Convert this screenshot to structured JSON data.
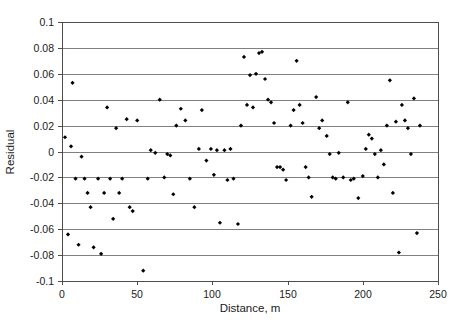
{
  "chart_data": {
    "type": "scatter",
    "title": "",
    "xlabel": "Distance, m",
    "ylabel": "Residual",
    "xlim": [
      0,
      250
    ],
    "ylim": [
      -0.1,
      0.1
    ],
    "xticks": [
      0,
      50,
      100,
      150,
      200,
      250
    ],
    "yticks": [
      -0.1,
      -0.08,
      -0.06,
      -0.04,
      -0.02,
      0,
      0.02,
      0.04,
      0.06,
      0.08,
      0.1
    ],
    "xtick_labels": [
      "0",
      "50",
      "100",
      "150",
      "200",
      "250"
    ],
    "ytick_labels": [
      "-0.1",
      "-0.08",
      "-0.06",
      "-0.04",
      "-0.02",
      "0",
      "0.02",
      "0.04",
      "0.06",
      "0.08",
      "0.1"
    ],
    "grid": "horizontal",
    "legend": null,
    "marker": "filled-diamond",
    "marker_color": "#000000",
    "points": [
      [
        2,
        0.011
      ],
      [
        4,
        -0.064
      ],
      [
        6,
        0.004
      ],
      [
        7,
        0.053
      ],
      [
        9,
        -0.021
      ],
      [
        11,
        -0.072
      ],
      [
        13,
        -0.004
      ],
      [
        15,
        -0.021
      ],
      [
        17,
        -0.032
      ],
      [
        19,
        -0.043
      ],
      [
        21,
        -0.074
      ],
      [
        24,
        -0.021
      ],
      [
        26,
        -0.079
      ],
      [
        28,
        -0.032
      ],
      [
        30,
        0.034
      ],
      [
        32,
        -0.021
      ],
      [
        34,
        -0.052
      ],
      [
        36,
        0.018
      ],
      [
        38,
        -0.032
      ],
      [
        40,
        -0.021
      ],
      [
        43,
        0.025
      ],
      [
        45,
        -0.043
      ],
      [
        47,
        -0.046
      ],
      [
        50,
        0.024
      ],
      [
        54,
        -0.092
      ],
      [
        57,
        -0.021
      ],
      [
        59,
        0.001
      ],
      [
        62,
        -0.001
      ],
      [
        65,
        0.04
      ],
      [
        68,
        -0.02
      ],
      [
        70,
        -0.002
      ],
      [
        72,
        -0.003
      ],
      [
        74,
        -0.033
      ],
      [
        76,
        0.02
      ],
      [
        79,
        0.033
      ],
      [
        82,
        0.024
      ],
      [
        85,
        -0.021
      ],
      [
        88,
        -0.043
      ],
      [
        91,
        0.002
      ],
      [
        93,
        0.032
      ],
      [
        96,
        -0.007
      ],
      [
        99,
        0.002
      ],
      [
        101,
        -0.018
      ],
      [
        103,
        0.001
      ],
      [
        105,
        -0.055
      ],
      [
        108,
        0.001
      ],
      [
        110,
        -0.022
      ],
      [
        112,
        0.002
      ],
      [
        114,
        -0.021
      ],
      [
        117,
        -0.056
      ],
      [
        119,
        0.02
      ],
      [
        121,
        0.073
      ],
      [
        123,
        0.036
      ],
      [
        125,
        0.059
      ],
      [
        127,
        0.034
      ],
      [
        129,
        0.06
      ],
      [
        131,
        0.076
      ],
      [
        133,
        0.077
      ],
      [
        135,
        0.056
      ],
      [
        137,
        0.04
      ],
      [
        139,
        0.038
      ],
      [
        141,
        0.022
      ],
      [
        143,
        -0.012
      ],
      [
        145,
        -0.012
      ],
      [
        147,
        -0.014
      ],
      [
        149,
        -0.022
      ],
      [
        152,
        0.02
      ],
      [
        154,
        0.032
      ],
      [
        156,
        0.07
      ],
      [
        158,
        0.036
      ],
      [
        160,
        0.022
      ],
      [
        162,
        -0.012
      ],
      [
        164,
        -0.02
      ],
      [
        166,
        -0.035
      ],
      [
        169,
        0.042
      ],
      [
        171,
        0.018
      ],
      [
        173,
        0.024
      ],
      [
        176,
        0.012
      ],
      [
        178,
        -0.002
      ],
      [
        180,
        -0.02
      ],
      [
        182,
        -0.021
      ],
      [
        184,
        -0.001
      ],
      [
        187,
        -0.02
      ],
      [
        190,
        0.038
      ],
      [
        192,
        -0.022
      ],
      [
        194,
        -0.021
      ],
      [
        197,
        -0.036
      ],
      [
        200,
        -0.019
      ],
      [
        202,
        0.002
      ],
      [
        204,
        0.013
      ],
      [
        206,
        0.01
      ],
      [
        208,
        -0.002
      ],
      [
        210,
        -0.02
      ],
      [
        212,
        0.001
      ],
      [
        214,
        -0.01
      ],
      [
        216,
        0.02
      ],
      [
        218,
        0.055
      ],
      [
        220,
        -0.032
      ],
      [
        222,
        0.023
      ],
      [
        224,
        -0.078
      ],
      [
        226,
        0.036
      ],
      [
        228,
        0.024
      ],
      [
        230,
        0.018
      ],
      [
        232,
        -0.002
      ],
      [
        234,
        0.041
      ],
      [
        236,
        -0.063
      ],
      [
        238,
        0.02
      ]
    ]
  },
  "axes": {
    "x_title": "Distance, m",
    "y_title": "Residual"
  }
}
